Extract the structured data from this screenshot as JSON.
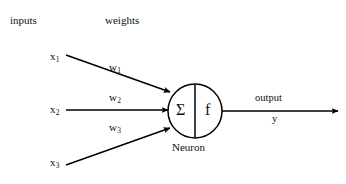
{
  "diagram": {
    "canvas": {
      "width": 346,
      "height": 184,
      "background": "#ffffff"
    },
    "stroke_color": "#000000",
    "text_color": "#111111",
    "headers": {
      "inputs_label": "inputs",
      "weights_label": "weights"
    },
    "inputs": [
      {
        "label": "x",
        "subscript": "1"
      },
      {
        "label": "x",
        "subscript": "2"
      },
      {
        "label": "x",
        "subscript": "3"
      }
    ],
    "weights": [
      {
        "label": "w",
        "subscript": "1"
      },
      {
        "label": "w",
        "subscript": "2"
      },
      {
        "label": "w",
        "subscript": "3"
      }
    ],
    "neuron": {
      "summation_symbol": "Σ",
      "activation_symbol": "f",
      "caption": "Neuron"
    },
    "output": {
      "label": "output",
      "variable": "y"
    }
  }
}
